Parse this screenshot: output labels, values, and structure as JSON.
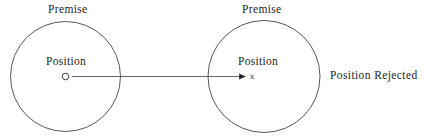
{
  "figure": {
    "background_color": "#ffffff",
    "stroke_color": "#3a3a3a",
    "text_color": "#1d1d1d",
    "width": 424,
    "height": 139,
    "left_node": {
      "premise_label": "Premise",
      "position_label": "Position",
      "marker_type": "open-circle",
      "circle": {
        "cx": 65.5,
        "cy": 76.5,
        "r": 55
      },
      "marker": {
        "cx": 65.5,
        "cy": 76.5,
        "r": 3.2
      }
    },
    "right_node": {
      "premise_label": "Premise",
      "position_label": "Position",
      "marker_type": "x-mark",
      "marker_label": "x",
      "circle": {
        "cx": 264,
        "cy": 76.5,
        "r": 56
      },
      "marker": {
        "cx": 253.5,
        "cy": 76.5
      }
    },
    "arrow": {
      "x1": 72,
      "y1": 76.5,
      "x2": 246,
      "y2": 76.5,
      "head": "solid-triangle"
    },
    "conclusion_label": "Position Rejected"
  }
}
